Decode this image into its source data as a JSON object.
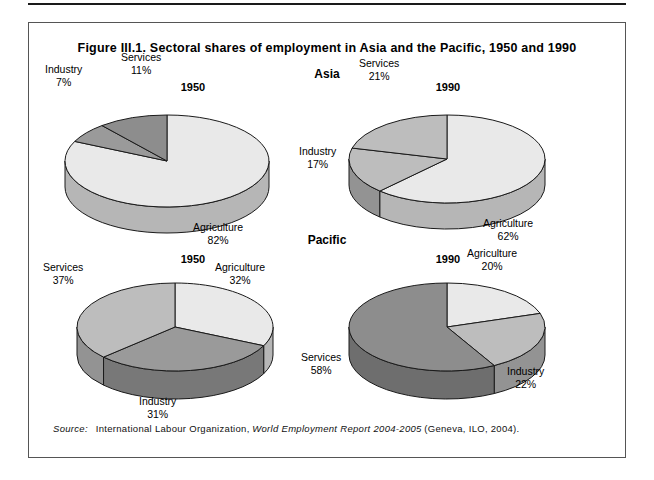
{
  "figure": {
    "title": "Figure III.1. Sectoral shares of employment in Asia and the Pacific, 1950 and 1990",
    "regions": [
      {
        "id": "asia",
        "name": "Asia"
      },
      {
        "id": "pacific",
        "name": "Pacific"
      }
    ],
    "source": {
      "label": "Source:",
      "text_before": "International Labour Organization,",
      "italic_title": "World Employment Report 2004-2005",
      "text_after": "(Geneva, ILO, 2004)."
    }
  },
  "years": {
    "asia_1950": "1950",
    "asia_1990": "1990",
    "pacific_1950": "1950",
    "pacific_1990": "1990"
  },
  "labels": {
    "asia_1950": {
      "industry_name": "Industry",
      "industry_pct": "7%",
      "services_name": "Services",
      "services_pct": "11%",
      "agriculture_name": "Agriculture",
      "agriculture_pct": "82%"
    },
    "asia_1990": {
      "services_name": "Services",
      "services_pct": "21%",
      "industry_name": "Industry",
      "industry_pct": "17%",
      "agriculture_name": "Agriculture",
      "agriculture_pct": "62%"
    },
    "pacific_1950": {
      "services_name": "Services",
      "services_pct": "37%",
      "agriculture_name": "Agriculture",
      "agriculture_pct": "32%",
      "industry_name": "Industry",
      "industry_pct": "31%"
    },
    "pacific_1990": {
      "agriculture_name": "Agriculture",
      "agriculture_pct": "20%",
      "industry_name": "Industry",
      "industry_pct": "22%",
      "services_name": "Services",
      "services_pct": "58%"
    }
  },
  "colors": {
    "agriculture": "#e9e9e9",
    "industry_light": "#9a9a9a",
    "services_mid": "#bdbdbd",
    "services_dark": "#8d8d8d",
    "side_wall": "#9a9a9a",
    "side_wall_dark": "#6f6f6f",
    "outline": "#1a1a1a",
    "frame": "#555555"
  },
  "chart_data": [
    {
      "type": "pie",
      "title": "Asia 1950",
      "region": "Asia",
      "year": 1950,
      "categories": [
        "Agriculture",
        "Industry",
        "Services"
      ],
      "values": [
        82,
        7,
        11
      ],
      "unit": "percent",
      "labels": [
        "Agriculture 82%",
        "Industry 7%",
        "Services 11%"
      ],
      "legend": "none",
      "three_d": true
    },
    {
      "type": "pie",
      "title": "Asia 1990",
      "region": "Asia",
      "year": 1990,
      "categories": [
        "Agriculture",
        "Industry",
        "Services"
      ],
      "values": [
        62,
        17,
        21
      ],
      "unit": "percent",
      "labels": [
        "Agriculture 62%",
        "Industry 17%",
        "Services 21%"
      ],
      "legend": "none",
      "three_d": true
    },
    {
      "type": "pie",
      "title": "Pacific 1950",
      "region": "Pacific",
      "year": 1950,
      "categories": [
        "Agriculture",
        "Industry",
        "Services"
      ],
      "values": [
        32,
        31,
        37
      ],
      "unit": "percent",
      "labels": [
        "Agriculture 32%",
        "Industry 31%",
        "Services 37%"
      ],
      "legend": "none",
      "three_d": true
    },
    {
      "type": "pie",
      "title": "Pacific 1990",
      "region": "Pacific",
      "year": 1990,
      "categories": [
        "Agriculture",
        "Industry",
        "Services"
      ],
      "values": [
        20,
        22,
        58
      ],
      "unit": "percent",
      "labels": [
        "Agriculture 20%",
        "Industry 22%",
        "Services 58%"
      ],
      "legend": "none",
      "three_d": true
    }
  ]
}
